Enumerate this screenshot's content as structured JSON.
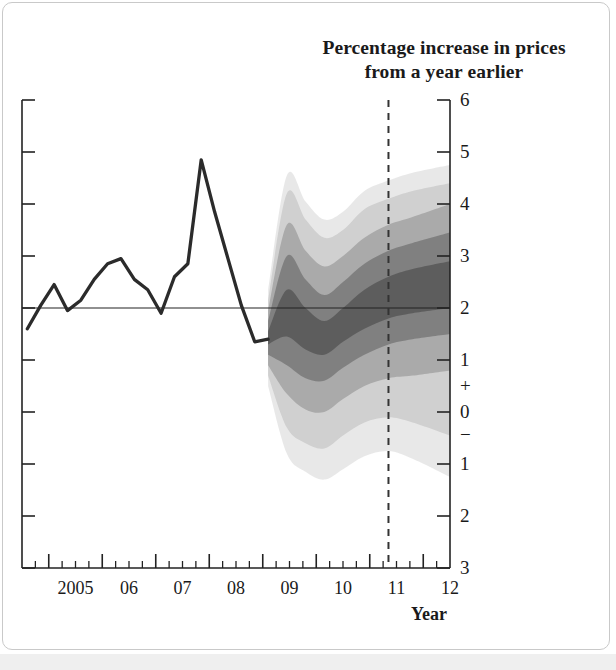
{
  "chart_data": {
    "type": "area",
    "title": "Percentage increase in prices from a year earlier",
    "title_line1": "Percentage increase in prices",
    "title_line2": "from a year earlier",
    "xlabel": "Year",
    "ylabel": "",
    "xlim": [
      2004.5,
      2012.5
    ],
    "ylim": [
      -3,
      6
    ],
    "grid": false,
    "legend": "none",
    "y_ticks": [
      6,
      5,
      4,
      3,
      2,
      1,
      0,
      -1,
      -2,
      -3
    ],
    "y_tick_labels": [
      "6",
      "5",
      "4",
      "3",
      "2",
      "1",
      "0",
      "1",
      "2",
      "3"
    ],
    "y_sign_marks": [
      {
        "label": "+",
        "value": 0.5
      },
      {
        "label": "−",
        "value": -0.45
      }
    ],
    "x_ticks": [
      2005,
      2006,
      2007,
      2008,
      2009,
      2010,
      2011,
      2012
    ],
    "x_tick_labels": [
      "2005",
      "06",
      "07",
      "08",
      "09",
      "10",
      "11",
      "12"
    ],
    "x_minor_ticks_per_year": 4,
    "target_line": {
      "value": 2.0,
      "style": "solid",
      "label": "2% inflation target"
    },
    "forecast_divider": {
      "x": 2011.35,
      "style": "dashed"
    },
    "series": [
      {
        "name": "CPI inflation (actual)",
        "type": "line",
        "color": "#2b2b2b",
        "x": [
          2004.6,
          2004.85,
          2005.1,
          2005.35,
          2005.6,
          2005.85,
          2006.1,
          2006.35,
          2006.6,
          2006.85,
          2007.1,
          2007.35,
          2007.6,
          2007.85,
          2008.1,
          2008.35,
          2008.6,
          2008.85,
          2009.1
        ],
        "values": [
          1.6,
          2.05,
          2.45,
          1.95,
          2.15,
          2.55,
          2.85,
          2.95,
          2.55,
          2.35,
          1.9,
          2.6,
          2.85,
          4.85,
          3.85,
          2.95,
          2.05,
          1.35,
          1.4
        ]
      }
    ],
    "fan": {
      "name": "Projection probability distribution",
      "description": "Bank of England style fan chart: shaded probability bands widening into the forecast period",
      "start_x": 2009.1,
      "end_x": 2012.5,
      "color_dark": "#3b3b3b",
      "color_light": "#e8e8e8",
      "bands": [
        {
          "prob": 10,
          "x": [
            2009.1,
            2009.45,
            2009.8,
            2010.15,
            2010.5,
            2010.9,
            2011.35,
            2011.8,
            2012.5
          ],
          "upper": [
            1.55,
            2.35,
            2.0,
            1.75,
            2.0,
            2.35,
            2.6,
            2.75,
            2.9
          ],
          "lower": [
            1.3,
            1.45,
            1.2,
            1.1,
            1.35,
            1.6,
            1.8,
            1.9,
            2.0
          ]
        },
        {
          "prob": 30,
          "x": [
            2009.1,
            2009.45,
            2009.8,
            2010.15,
            2010.5,
            2010.9,
            2011.35,
            2011.8,
            2012.5
          ],
          "upper": [
            1.75,
            3.0,
            2.55,
            2.25,
            2.5,
            2.85,
            3.1,
            3.25,
            3.45
          ],
          "lower": [
            1.1,
            0.9,
            0.65,
            0.6,
            0.85,
            1.1,
            1.3,
            1.4,
            1.5
          ]
        },
        {
          "prob": 60,
          "x": [
            2009.1,
            2009.45,
            2009.8,
            2010.15,
            2010.5,
            2010.9,
            2011.35,
            2011.8,
            2012.5
          ],
          "upper": [
            1.95,
            3.6,
            3.1,
            2.8,
            3.0,
            3.35,
            3.6,
            3.75,
            4.0
          ],
          "lower": [
            0.9,
            0.35,
            0.05,
            0.0,
            0.25,
            0.5,
            0.65,
            0.7,
            0.8
          ]
        },
        {
          "prob": 90,
          "x": [
            2009.1,
            2009.45,
            2009.8,
            2010.15,
            2010.5,
            2010.9,
            2011.35,
            2011.8,
            2012.5
          ],
          "upper": [
            2.15,
            4.2,
            3.7,
            3.35,
            3.5,
            3.9,
            4.1,
            4.25,
            4.4
          ],
          "lower": [
            0.7,
            -0.3,
            -0.6,
            -0.7,
            -0.45,
            -0.2,
            -0.1,
            -0.2,
            -0.45
          ]
        },
        {
          "prob": 98,
          "x": [
            2009.1,
            2009.45,
            2009.8,
            2010.15,
            2010.5,
            2010.9,
            2011.35,
            2011.8,
            2012.5
          ],
          "upper": [
            2.35,
            4.55,
            4.05,
            3.7,
            3.85,
            4.25,
            4.45,
            4.6,
            4.75
          ],
          "lower": [
            0.5,
            -0.8,
            -1.15,
            -1.3,
            -1.1,
            -0.85,
            -0.75,
            -0.9,
            -1.25
          ]
        }
      ]
    }
  }
}
